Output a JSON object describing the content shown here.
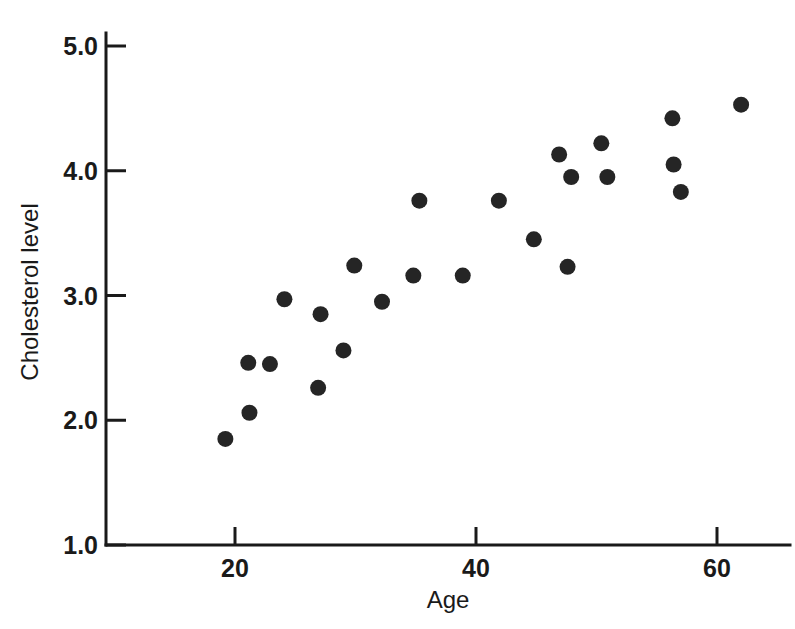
{
  "chart_data": {
    "type": "scatter",
    "title": "",
    "xlabel": "Age",
    "ylabel": "Cholesterol level",
    "xlim": [
      10,
      65
    ],
    "ylim": [
      1.0,
      5.2
    ],
    "grid": false,
    "legend": null,
    "xticks": [
      20,
      40,
      60
    ],
    "xtick_labels": [
      "20",
      "40",
      "60"
    ],
    "yticks": [
      1.0,
      2.0,
      3.0,
      4.0,
      5.0
    ],
    "ytick_labels": [
      "1.0",
      "2.0",
      "3.0",
      "4.0",
      "5.0"
    ],
    "marker": {
      "shape": "circle",
      "color": "#252525",
      "size_px": 16
    },
    "x": [
      19.2,
      21.1,
      21.2,
      22.9,
      24.1,
      26.9,
      27.1,
      29.0,
      29.9,
      32.2,
      34.8,
      35.3,
      38.9,
      41.9,
      44.8,
      46.9,
      47.6,
      47.9,
      50.4,
      50.9,
      56.3,
      56.4,
      57.0,
      62.0
    ],
    "y": [
      1.85,
      2.46,
      2.06,
      2.45,
      2.97,
      2.26,
      2.85,
      2.56,
      3.24,
      2.95,
      3.16,
      3.76,
      3.16,
      3.76,
      3.45,
      4.13,
      3.23,
      3.95,
      4.22,
      3.95,
      4.42,
      4.05,
      3.83,
      4.53
    ],
    "points": [
      {
        "age": 19.2,
        "cholesterol": 1.85
      },
      {
        "age": 21.1,
        "cholesterol": 2.46
      },
      {
        "age": 21.2,
        "cholesterol": 2.06
      },
      {
        "age": 22.9,
        "cholesterol": 2.45
      },
      {
        "age": 24.1,
        "cholesterol": 2.97
      },
      {
        "age": 26.9,
        "cholesterol": 2.26
      },
      {
        "age": 27.1,
        "cholesterol": 2.85
      },
      {
        "age": 29.0,
        "cholesterol": 2.56
      },
      {
        "age": 29.9,
        "cholesterol": 3.24
      },
      {
        "age": 32.2,
        "cholesterol": 2.95
      },
      {
        "age": 34.8,
        "cholesterol": 3.16
      },
      {
        "age": 35.3,
        "cholesterol": 3.76
      },
      {
        "age": 38.9,
        "cholesterol": 3.16
      },
      {
        "age": 41.9,
        "cholesterol": 3.76
      },
      {
        "age": 44.8,
        "cholesterol": 3.45
      },
      {
        "age": 46.9,
        "cholesterol": 4.13
      },
      {
        "age": 47.6,
        "cholesterol": 3.23
      },
      {
        "age": 47.9,
        "cholesterol": 3.95
      },
      {
        "age": 50.4,
        "cholesterol": 4.22
      },
      {
        "age": 50.9,
        "cholesterol": 3.95
      },
      {
        "age": 56.3,
        "cholesterol": 4.42
      },
      {
        "age": 56.4,
        "cholesterol": 4.05
      },
      {
        "age": 57.0,
        "cholesterol": 3.83
      },
      {
        "age": 62.0,
        "cholesterol": 4.53
      }
    ]
  },
  "axes": {
    "y_axis_label": "Cholesterol level",
    "x_axis_label": "Age",
    "y_tick_labels": [
      "5.0",
      "4.0",
      "3.0",
      "2.0",
      "1.0"
    ],
    "x_tick_labels": [
      "20",
      "40",
      "60"
    ]
  },
  "colors": {
    "marker": "#252525",
    "axis": "#1a1a1a",
    "background": "#ffffff"
  }
}
